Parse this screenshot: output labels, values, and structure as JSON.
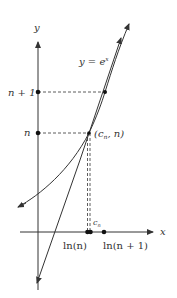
{
  "diagram": {
    "title": "",
    "axes": {
      "x_label": "x",
      "y_label": "y"
    },
    "curve_label": "y = e",
    "curve_label_exponent": "x",
    "y_ticks": [
      {
        "label": "n + 1"
      },
      {
        "label": "n"
      }
    ],
    "x_ticks": [
      {
        "label": "ln(n)"
      },
      {
        "label": "ln(n + 1)"
      }
    ],
    "point_label": "(c",
    "point_label_sub": "n",
    "point_label_tail": ", n)",
    "cn_label": "c",
    "cn_label_sub": "n",
    "colors": {
      "stroke": "#333333",
      "background": "#ffffff"
    }
  }
}
